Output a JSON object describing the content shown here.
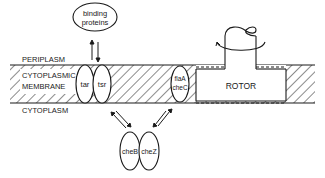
{
  "diagram": {
    "regions": {
      "periplasm": "PERIPLASM",
      "membrane_line1": "CYTOPLASMIC",
      "membrane_line2": "MEMBRANE",
      "cytoplasm": "CYTOPLASM"
    },
    "binding_proteins": {
      "line1": "binding",
      "line2": "proteins"
    },
    "receptors": {
      "left": "tar",
      "right": "tsr"
    },
    "switch": {
      "line1": "flaA",
      "line2": "cheC"
    },
    "rotor": "ROTOR",
    "cytoplasmic_proteins": {
      "left": "cheB",
      "right": "cheZ"
    },
    "colors": {
      "ink": "#1a1a1a",
      "background": "#ffffff"
    }
  }
}
